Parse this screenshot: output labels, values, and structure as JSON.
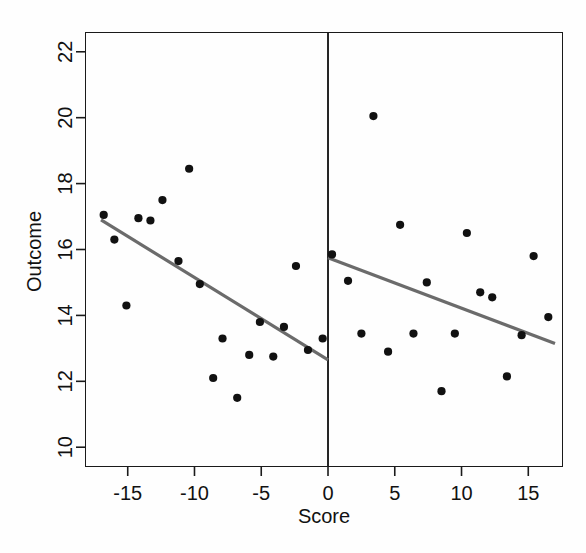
{
  "figure": {
    "kind": "regression-discontinuity-scatter",
    "background_color": "#fefefe",
    "point_color": "#111111",
    "line_color": "#6b6b6b",
    "axis_color": "#1a1a1a",
    "cutoff_line_color": "#000000"
  },
  "axes": {
    "x_label": "Score",
    "y_label": "Outcome",
    "x_ticks": [
      "-15",
      "-10",
      "-5",
      "0",
      "5",
      "10",
      "15"
    ],
    "y_ticks": [
      "10",
      "12",
      "14",
      "16",
      "18",
      "20",
      "22"
    ]
  },
  "chart_data": {
    "type": "scatter",
    "title": "",
    "xlabel": "Score",
    "ylabel": "Outcome",
    "xlim": [
      -18.2,
      17.6
    ],
    "ylim": [
      9.4,
      22.6
    ],
    "x_ticks": [
      -15,
      -10,
      -5,
      0,
      5,
      10,
      15
    ],
    "y_ticks": [
      10,
      12,
      14,
      16,
      18,
      20,
      22
    ],
    "grid": false,
    "legend": null,
    "cutoff": 0,
    "cutoff_line": {
      "x": 0,
      "style": "solid",
      "color": "#000000",
      "label": "discontinuity cutoff"
    },
    "series": [
      {
        "name": "Observations below cutoff",
        "marker": "filled-circle",
        "color": "#111111",
        "points": [
          {
            "x": -16.8,
            "y": 17.05
          },
          {
            "x": -16.0,
            "y": 16.3
          },
          {
            "x": -15.1,
            "y": 14.3
          },
          {
            "x": -14.2,
            "y": 16.95
          },
          {
            "x": -13.3,
            "y": 16.88
          },
          {
            "x": -12.4,
            "y": 17.5
          },
          {
            "x": -11.2,
            "y": 15.65
          },
          {
            "x": -10.4,
            "y": 18.45
          },
          {
            "x": -9.6,
            "y": 14.95
          },
          {
            "x": -8.6,
            "y": 12.1
          },
          {
            "x": -7.9,
            "y": 13.3
          },
          {
            "x": -6.8,
            "y": 11.5
          },
          {
            "x": -5.9,
            "y": 12.8
          },
          {
            "x": -5.1,
            "y": 13.8
          },
          {
            "x": -4.1,
            "y": 12.75
          },
          {
            "x": -3.3,
            "y": 13.65
          },
          {
            "x": -2.4,
            "y": 15.5
          },
          {
            "x": -1.5,
            "y": 12.95
          },
          {
            "x": -0.4,
            "y": 13.3
          }
        ]
      },
      {
        "name": "Observations above cutoff",
        "marker": "filled-circle",
        "color": "#111111",
        "points": [
          {
            "x": 0.3,
            "y": 15.85
          },
          {
            "x": 1.5,
            "y": 15.05
          },
          {
            "x": 2.5,
            "y": 13.45
          },
          {
            "x": 3.4,
            "y": 20.05
          },
          {
            "x": 4.5,
            "y": 12.9
          },
          {
            "x": 5.4,
            "y": 16.75
          },
          {
            "x": 6.4,
            "y": 13.45
          },
          {
            "x": 7.4,
            "y": 15.0
          },
          {
            "x": 8.5,
            "y": 11.7
          },
          {
            "x": 9.5,
            "y": 13.45
          },
          {
            "x": 10.4,
            "y": 16.5
          },
          {
            "x": 11.4,
            "y": 14.7
          },
          {
            "x": 12.3,
            "y": 14.55
          },
          {
            "x": 13.4,
            "y": 12.15
          },
          {
            "x": 14.5,
            "y": 13.4
          },
          {
            "x": 15.4,
            "y": 15.8
          },
          {
            "x": 16.5,
            "y": 13.95
          }
        ]
      }
    ],
    "fit_lines": [
      {
        "name": "Left-side linear fit",
        "side": "below-cutoff",
        "color": "#6b6b6b",
        "x_start": -17.0,
        "y_start": 16.9,
        "x_end": 0.0,
        "y_end": 12.65,
        "slope": -0.25,
        "intercept": 12.65
      },
      {
        "name": "Right-side linear fit",
        "side": "above-cutoff",
        "color": "#6b6b6b",
        "x_start": 0.0,
        "y_start": 15.75,
        "x_end": 17.0,
        "y_end": 13.15,
        "slope": -0.153,
        "intercept": 15.75
      }
    ],
    "discontinuity_jump": 3.1
  }
}
